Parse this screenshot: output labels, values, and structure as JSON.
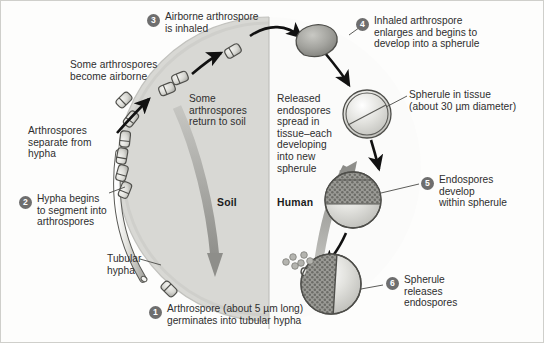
{
  "figure": {
    "regions": [
      {
        "id": "soil",
        "label": "Soil",
        "x": 216,
        "y": 196
      },
      {
        "id": "human",
        "label": "Human",
        "x": 276,
        "y": 196
      }
    ],
    "divider": {
      "x": 268,
      "color": "#b9b9b5"
    },
    "colors": {
      "soil_fill": "#d8d8d4",
      "human_fill": "#fbfbfa",
      "arrow_gray": "#9a9a96",
      "arrow_black": "#111111",
      "step_badge": "#6e6e6e",
      "text": "#2e2e2e",
      "outline": "#4a4a4a",
      "spore_fill": "#dcdcd8",
      "endospore_fill": "#8f8f8b"
    },
    "steps": [
      {
        "number": "1",
        "text": "Arthrospore (about 5 µm long)\ngerminates into tubular hypha",
        "badge_x": 148,
        "badge_y": 305,
        "text_x": 166,
        "text_y": 302
      },
      {
        "number": "2",
        "text": "Hypha begins\nto segment into\narthrospores",
        "badge_x": 18,
        "badge_y": 195,
        "text_x": 36,
        "text_y": 192
      },
      {
        "number": "3",
        "text": "Airborne arthrospore\nis inhaled",
        "badge_x": 146,
        "badge_y": 13,
        "text_x": 164,
        "text_y": 10
      },
      {
        "number": "4",
        "text": "Inhaled arthrospore\nenlarges and begins to\ndevelop into a spherule",
        "badge_x": 355,
        "badge_y": 17,
        "text_x": 373,
        "text_y": 14
      },
      {
        "number": "5",
        "text": "Endospores\ndevelop\nwithin spherule",
        "badge_x": 420,
        "badge_y": 176,
        "text_x": 438,
        "text_y": 173
      },
      {
        "number": "6",
        "text": "Spherule\nreleases\nendospores",
        "badge_x": 385,
        "badge_y": 276,
        "text_x": 403,
        "text_y": 273
      }
    ],
    "annotations": [
      {
        "id": "some-arthrospores-become-airborne",
        "text": "Some arthrospores\nbecome airborne",
        "x": 69,
        "y": 58,
        "align": "left"
      },
      {
        "id": "arthrospores-separate-from-hypha",
        "text": "Arthrospores\nseparate from\nhypha",
        "x": 27,
        "y": 124,
        "align": "left"
      },
      {
        "id": "tubular-hypha",
        "text": "Tubular\nhypha",
        "x": 106,
        "y": 252,
        "align": "left"
      },
      {
        "id": "some-arthrospores-return-to-soil",
        "text": "Some\narthrospores\nreturn to soil",
        "x": 188,
        "y": 92,
        "align": "left"
      },
      {
        "id": "released-endospores-spread",
        "text": "Released\nendospores\nspread in\ntissue–each\ndeveloping\ninto new\nspherule",
        "x": 276,
        "y": 92,
        "align": "left"
      },
      {
        "id": "spherule-in-tissue",
        "text": "Spherule in tissue\n(about 30 µm diameter)",
        "x": 408,
        "y": 88,
        "align": "left"
      }
    ]
  }
}
